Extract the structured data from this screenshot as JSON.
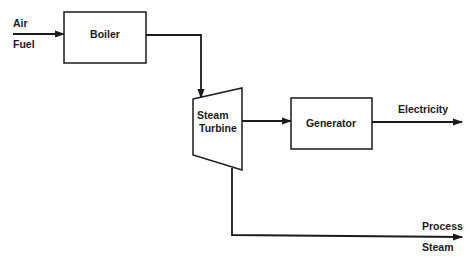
{
  "diagram": {
    "type": "process-flow",
    "inputs": {
      "air": "Air",
      "fuel": "Fuel"
    },
    "nodes": {
      "boiler": "Boiler",
      "turbine_line1": "Steam",
      "turbine_line2": "Turbine",
      "generator": "Generator"
    },
    "outputs": {
      "electricity": "Electricity",
      "process_line1": "Process",
      "process_line2": "Steam"
    },
    "edges": [
      {
        "from": "Air/Fuel",
        "to": "Boiler"
      },
      {
        "from": "Boiler",
        "to": "Steam Turbine"
      },
      {
        "from": "Steam Turbine",
        "to": "Generator"
      },
      {
        "from": "Generator",
        "to": "Electricity"
      },
      {
        "from": "Steam Turbine",
        "to": "Process Steam"
      }
    ]
  }
}
